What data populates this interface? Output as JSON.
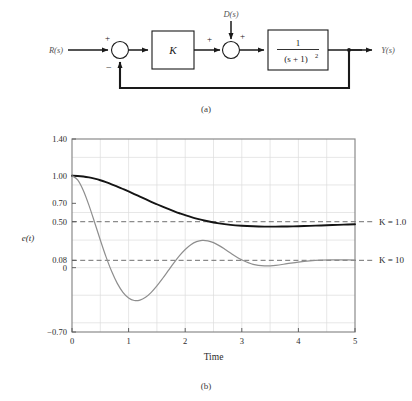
{
  "figure": {
    "caption_a": "(a)",
    "caption_b": "(b)"
  },
  "block_diagram": {
    "input_label": "R(s)",
    "disturbance_label": "D(s)",
    "output_label": "Y(s)",
    "gain_block_label": "K",
    "plant_numerator": "1",
    "plant_denominator": "(s + 1)",
    "plant_denominator_exponent": "2",
    "sum1_plus": "+",
    "sum1_minus": "−",
    "sum2_plus_left": "+",
    "sum2_plus_top": "+",
    "line_color": "#1a1a1a"
  },
  "chart_data": {
    "type": "line",
    "title": "",
    "xlabel": "Time",
    "ylabel": "e(t)",
    "xlim": [
      0,
      5
    ],
    "ylim": [
      -0.7,
      1.4
    ],
    "grid": true,
    "xticks": [
      0,
      1,
      2,
      3,
      4,
      5
    ],
    "xtick_labels": [
      "0",
      "1",
      "2",
      "3",
      "4",
      "5"
    ],
    "yticks": [
      1.4,
      1.0,
      0.7,
      0.5,
      0.08,
      0,
      -0.7
    ],
    "ytick_labels": [
      "1.40",
      "1.00",
      "0.70",
      "0.50",
      "0.08",
      "0",
      "−0.70"
    ],
    "grid_x_step": 0.5,
    "grid_y_step": 0.3,
    "reference_lines": [
      {
        "name": "steady-state-K1",
        "y": 0.5,
        "style": "dashed",
        "color": "#6f6f6f"
      },
      {
        "name": "steady-state-K10",
        "y": 0.08,
        "style": "dashed",
        "color": "#6f6f6f"
      }
    ],
    "legend_position": "right-of-axes",
    "series": [
      {
        "name": "K = 1.0",
        "label": "K = 1.0",
        "color": "#141414",
        "width": 1.9,
        "steady_state": 0.5,
        "x": [
          0,
          0.1,
          0.2,
          0.3,
          0.4,
          0.5,
          0.6,
          0.7,
          0.8,
          0.9,
          1.0,
          1.1,
          1.2,
          1.3,
          1.4,
          1.5,
          1.6,
          1.7,
          1.8,
          1.9,
          2.0,
          2.2,
          2.4,
          2.6,
          2.8,
          3.0,
          3.2,
          3.4,
          3.6,
          3.8,
          4.0,
          4.2,
          4.4,
          4.6,
          4.8,
          5.0
        ],
        "y": [
          1.0,
          0.998,
          0.992,
          0.982,
          0.968,
          0.951,
          0.93,
          0.907,
          0.882,
          0.856,
          0.829,
          0.801,
          0.773,
          0.745,
          0.717,
          0.69,
          0.664,
          0.639,
          0.615,
          0.592,
          0.571,
          0.534,
          0.505,
          0.482,
          0.466,
          0.456,
          0.45,
          0.447,
          0.447,
          0.448,
          0.451,
          0.455,
          0.459,
          0.464,
          0.468,
          0.472
        ]
      },
      {
        "name": "K = 10",
        "label": "K = 10",
        "color": "#8e8e8e",
        "width": 1.2,
        "steady_state": 0.08,
        "x": [
          0,
          0.1,
          0.2,
          0.3,
          0.4,
          0.5,
          0.6,
          0.7,
          0.8,
          0.9,
          1.0,
          1.1,
          1.2,
          1.3,
          1.4,
          1.5,
          1.6,
          1.7,
          1.8,
          1.9,
          2.0,
          2.1,
          2.2,
          2.3,
          2.4,
          2.5,
          2.6,
          2.7,
          2.8,
          2.9,
          3.0,
          3.2,
          3.4,
          3.6,
          3.8,
          4.0,
          4.2,
          4.4,
          4.6,
          4.8,
          5.0
        ],
        "y": [
          1.0,
          0.955,
          0.84,
          0.678,
          0.492,
          0.301,
          0.12,
          -0.04,
          -0.171,
          -0.268,
          -0.33,
          -0.357,
          -0.353,
          -0.322,
          -0.268,
          -0.198,
          -0.118,
          -0.033,
          0.052,
          0.131,
          0.198,
          0.25,
          0.283,
          0.297,
          0.292,
          0.272,
          0.24,
          0.201,
          0.159,
          0.119,
          0.085,
          0.036,
          0.019,
          0.025,
          0.043,
          0.061,
          0.074,
          0.082,
          0.085,
          0.085,
          0.083
        ]
      }
    ]
  }
}
